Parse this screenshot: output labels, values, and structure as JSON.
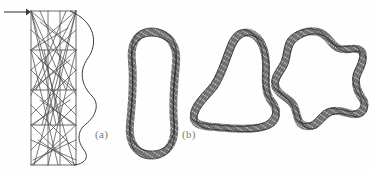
{
  "figure": {
    "background_color": "#fefefe",
    "ink_color": "#3c3c3c",
    "label_color": "#7a7a7a",
    "width": 372,
    "height": 172,
    "panels": [
      {
        "id": "a",
        "label": "(a)",
        "kind": "triangulated-strip-diagram",
        "description": "rectangular domain with horizontal division lines, many diagonal chords forming a triangulated mesh, and a smooth wavy curve bulging to the right",
        "arrow": {
          "name": "incoming-arrow",
          "direction": "right",
          "x1": 4,
          "y1": 12,
          "x2": 29,
          "y2": 12
        },
        "rect": {
          "x": 31,
          "y": 11,
          "width": 45,
          "height": 154
        },
        "horizontal_lines_y": [
          50,
          90,
          125
        ],
        "chords": [
          [
            31,
            11,
            76,
            50
          ],
          [
            76,
            11,
            31,
            50
          ],
          [
            31,
            11,
            66,
            90
          ],
          [
            76,
            11,
            36,
            90
          ],
          [
            31,
            50,
            72,
            90
          ],
          [
            76,
            50,
            34,
            90
          ],
          [
            31,
            50,
            68,
            28
          ],
          [
            76,
            50,
            40,
            22
          ],
          [
            31,
            90,
            74,
            125
          ],
          [
            76,
            90,
            33,
            125
          ],
          [
            31,
            90,
            70,
            60
          ],
          [
            76,
            90,
            38,
            58
          ],
          [
            31,
            125,
            72,
            165
          ],
          [
            76,
            125,
            33,
            165
          ],
          [
            31,
            125,
            70,
            100
          ],
          [
            76,
            125,
            40,
            100
          ],
          [
            31,
            165,
            74,
            125
          ],
          [
            76,
            165,
            33,
            125
          ],
          [
            31,
            165,
            66,
            140
          ],
          [
            76,
            165,
            38,
            140
          ],
          [
            31,
            11,
            74,
            165
          ],
          [
            76,
            11,
            34,
            165
          ],
          [
            40,
            11,
            76,
            95
          ],
          [
            66,
            11,
            31,
            95
          ],
          [
            31,
            30,
            76,
            70
          ],
          [
            76,
            30,
            31,
            70
          ],
          [
            31,
            70,
            76,
            115
          ],
          [
            76,
            70,
            31,
            115
          ],
          [
            31,
            105,
            76,
            150
          ],
          [
            76,
            105,
            31,
            150
          ],
          [
            44,
            50,
            60,
            125
          ],
          [
            62,
            50,
            42,
            125
          ],
          [
            31,
            140,
            76,
            160
          ],
          [
            76,
            140,
            33,
            160
          ],
          [
            48,
            11,
            48,
            165
          ],
          [
            60,
            11,
            60,
            165
          ]
        ],
        "wavy_curve": {
          "name": "smooth-boundary-curve",
          "path": "M 70 11 C 96 22 98 44 88 58 C 78 72 82 86 92 96 C 100 104 96 116 86 124 C 76 132 78 142 84 150 C 90 158 84 164 74 165"
        }
      },
      {
        "id": "b",
        "label": "(b)",
        "kind": "braided-closed-loops",
        "description": "three braided ring-shaped closed loops drawn as textured tubes",
        "loops": [
          {
            "name": "loop-oval",
            "shape": "elongated-oval",
            "path": "M 152 32 C 170 33 178 46 176 64 C 174 84 172 104 174 122 C 176 140 170 154 153 155 C 136 156 128 142 130 124 C 132 104 134 80 132 62 C 130 44 136 32 152 32 Z"
          },
          {
            "name": "loop-triangle",
            "shape": "rounded-triangle",
            "path": "M 250 33 C 262 37 266 52 266 66 C 266 80 264 92 272 102 C 280 112 276 124 262 127 C 246 131 228 128 214 127 C 200 126 192 124 194 114 C 196 104 206 96 214 86 C 222 74 226 58 232 44 C 237 34 243 31 250 33 Z"
          },
          {
            "name": "loop-star",
            "shape": "four-lobed-star",
            "path": "M 318 32 C 328 34 330 44 338 48 C 346 52 354 46 360 50 C 366 54 362 64 358 72 C 354 80 356 90 362 98 C 368 106 362 116 352 114 C 342 112 334 108 326 114 C 318 120 316 128 306 126 C 296 124 298 114 294 106 C 290 98 280 96 276 88 C 272 80 280 72 284 64 C 288 56 286 44 294 38 C 302 32 310 30 318 32 Z"
          }
        ]
      }
    ]
  }
}
